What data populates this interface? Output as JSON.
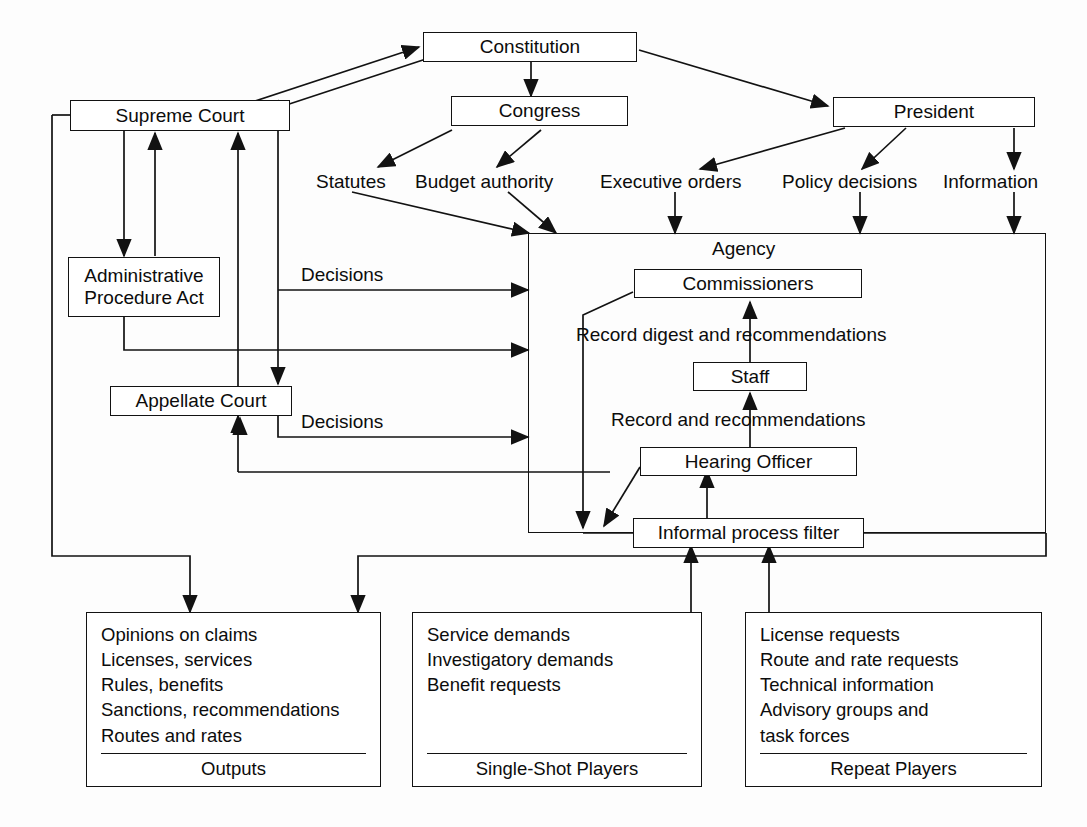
{
  "diagram": {
    "title_caption": "",
    "nodes": {
      "constitution": "Constitution",
      "congress": "Congress",
      "president": "President",
      "supreme_court": "Supreme Court",
      "apa_line1": "Administrative",
      "apa_line2": "Procedure Act",
      "appellate_court": "Appellate Court",
      "agency": "Agency",
      "commissioners": "Commissioners",
      "staff": "Staff",
      "hearing_officer": "Hearing Officer",
      "informal_process_filter": "Informal process filter"
    },
    "flow_labels": {
      "statutes": "Statutes",
      "budget_authority": "Budget authority",
      "executive_orders": "Executive orders",
      "policy_decisions": "Policy decisions",
      "information": "Information",
      "decisions_upper": "Decisions",
      "decisions_lower": "Decisions",
      "record_digest": "Record digest and recommendations",
      "record_recs": "Record and recommendations"
    },
    "panels": [
      {
        "id": "outputs",
        "items": [
          "Opinions on claims",
          "Licenses, services",
          "Rules, benefits",
          "Sanctions, recommendations",
          "Routes and rates"
        ],
        "caption": "Outputs"
      },
      {
        "id": "single-shot-players",
        "items": [
          "Service demands",
          "Investigatory demands",
          "Benefit requests"
        ],
        "caption": "Single-Shot Players"
      },
      {
        "id": "repeat-players",
        "items": [
          "License requests",
          "Route and rate requests",
          "Technical information",
          "Advisory groups and",
          "task forces"
        ],
        "caption": "Repeat Players"
      }
    ],
    "colors": {
      "ink": "#121212",
      "paper": "#fdfdfd"
    }
  }
}
